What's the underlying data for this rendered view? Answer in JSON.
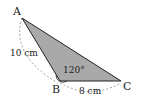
{
  "diagram": {
    "type": "triangle",
    "fill_color": "#a9a9a9",
    "stroke_color": "#222222",
    "vertices": [
      {
        "label": "A",
        "x": 22,
        "y": 18
      },
      {
        "label": "B",
        "x": 60,
        "y": 81
      },
      {
        "label": "C",
        "x": 121,
        "y": 81
      }
    ],
    "angle_label": "120°",
    "side_labels": {
      "AB": "10 cm",
      "BC": "8 cm"
    }
  }
}
